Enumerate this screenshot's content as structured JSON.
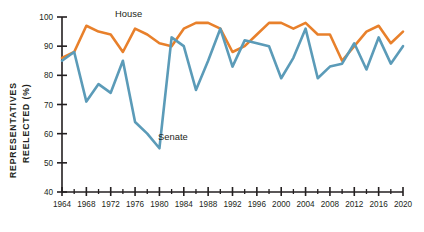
{
  "chart_data": {
    "type": "line",
    "title": "",
    "xlabel": "",
    "ylabel": "REPRESENTATIVES REELECTED (%)",
    "ylabel_line1": "REPRESENTATIVES",
    "ylabel_line2": "REELECTED (%)",
    "xlim": [
      1964,
      2020
    ],
    "ylim": [
      40,
      100
    ],
    "ytick_values": [
      40,
      50,
      60,
      70,
      80,
      90,
      100
    ],
    "ytick_labels": [
      "40",
      "50",
      "60",
      "70",
      "80",
      "90",
      "100"
    ],
    "xtick_values": [
      1964,
      1968,
      1972,
      1976,
      1980,
      1984,
      1988,
      1992,
      1996,
      2000,
      2004,
      2008,
      2012,
      2016,
      2020
    ],
    "xtick_labels": [
      "1964",
      "1968",
      "1972",
      "1976",
      "1980",
      "1984",
      "1988",
      "1992",
      "1996",
      "2000",
      "2004",
      "2008",
      "2012",
      "2016",
      "2020"
    ],
    "xminor_values": [
      1966,
      1970,
      1974,
      1978,
      1982,
      1986,
      1990,
      1994,
      1998,
      2002,
      2006,
      2010,
      2014,
      2018
    ],
    "grid": false,
    "legend_position": "inline-annotations",
    "x": [
      1964,
      1966,
      1968,
      1970,
      1972,
      1974,
      1976,
      1978,
      1980,
      1982,
      1984,
      1986,
      1988,
      1990,
      1992,
      1994,
      1996,
      1998,
      2000,
      2002,
      2004,
      2006,
      2008,
      2010,
      2012,
      2014,
      2016,
      2018,
      2020
    ],
    "series": [
      {
        "name": "House",
        "color": "#E8802B",
        "values": [
          86,
          88,
          97,
          95,
          94,
          88,
          96,
          94,
          91,
          90,
          96,
          98,
          98,
          96,
          88,
          90,
          94,
          98,
          98,
          96,
          98,
          94,
          94,
          85,
          90,
          95,
          97,
          91,
          95
        ]
      },
      {
        "name": "Senate",
        "color": "#5B9BB8",
        "values": [
          85,
          88,
          71,
          77,
          74,
          85,
          64,
          60,
          55,
          93,
          90,
          75,
          85,
          96,
          83,
          92,
          91,
          90,
          79,
          86,
          96,
          79,
          83,
          84,
          91,
          82,
          93,
          84,
          90
        ]
      }
    ],
    "annotations": [
      {
        "label": "House",
        "series": "House"
      },
      {
        "label": "Senate",
        "series": "Senate"
      }
    ]
  },
  "colors": {
    "house": "#E8802B",
    "senate": "#5B9BB8",
    "axis": "#231f20",
    "background": "#ffffff"
  }
}
